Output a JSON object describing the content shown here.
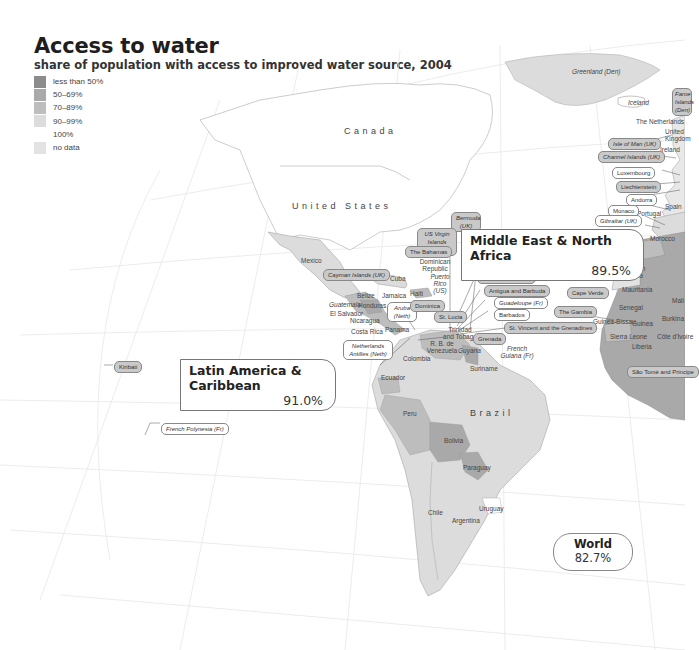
{
  "header": {
    "title": "Access to water",
    "subtitle": "share of population with access to improved water source, 2004"
  },
  "legend": [
    {
      "label": "less than 50%",
      "color": "#8c8c8c"
    },
    {
      "label": "50–69%",
      "color": "#a9a9a9"
    },
    {
      "label": "70–89%",
      "color": "#bdbdbd"
    },
    {
      "label": "90–99%",
      "color": "#dcdcdc"
    },
    {
      "label": "100%",
      "color": "#ffffff"
    },
    {
      "label": "no data",
      "color": "#e3e3e3"
    }
  ],
  "regions": {
    "latin_america": {
      "name": "Latin America & Caribbean",
      "value": "91.0%"
    },
    "mena": {
      "name": "Middle East & North Africa",
      "value": "89.5%"
    },
    "world": {
      "name": "World",
      "value": "82.7%"
    }
  },
  "country_names": {
    "canada": "Canada",
    "united_states": "United States",
    "brazil": "Brazil"
  },
  "labels": {
    "greenland": "Greenland (Den)",
    "iceland": "Iceland",
    "faroe": "Faroe Islands (Den)",
    "netherlands": "The Netherlands",
    "united_kingdom": "United Kingdom",
    "ireland": "Ireland",
    "isle_of_man": "Isle of Man (UK)",
    "channel_islands": "Channel Islands (UK)",
    "luxembourg": "Luxembourg",
    "liechtenstein": "Liechtenstein",
    "andorra": "Andorra",
    "spain": "Spain",
    "monaco": "Monaco",
    "portugal": "Portugal",
    "gibraltar": "Gibraltar (UK)",
    "morocco": "Morocco",
    "western_sahara": "Former Spanish Sahara",
    "mauritania": "Mauritania",
    "mali": "Mali",
    "cape_verde": "Cape Verde",
    "senegal": "Senegal",
    "gambia": "The Gambia",
    "guinea_bissau": "Guinea-Bissau",
    "guinea": "Guinea",
    "sierra_leone": "Sierra Leone",
    "liberia": "Liberia",
    "burkina": "Burkina",
    "cote_divoire": "Côte d'Ivoire",
    "sao_tome": "São Tomé and Principe",
    "bermuda": "Bermuda (UK)",
    "us_virgin": "US Virgin Islands (US)",
    "bahamas": "The Bahamas",
    "dominican_republic": "Dominican Republic",
    "puerto_rico": "Puerto Rico (US)",
    "cuba": "Cuba",
    "haiti": "Haiti",
    "jamaica": "Jamaica",
    "cayman": "Cayman Islands (UK)",
    "mexico": "Mexico",
    "belize": "Belize",
    "guatemala": "Guatemala",
    "honduras": "Honduras",
    "el_salvador": "El Salvador",
    "nicaragua": "Nicaragua",
    "costa_rica": "Costa Rica",
    "panama": "Panama",
    "aruba": "Aruba (Neth)",
    "netherlands_antilles": "Netherlands Antilles (Neth)",
    "dominica": "Dominica",
    "st_lucia": "St. Lucia",
    "st_kitts": "St. Kitts and Nevis",
    "antigua": "Antigua and Barbuda",
    "guadeloupe": "Guadeloupe (Fr)",
    "barbados": "Barbados",
    "st_vincent": "St. Vincent and the Grenadines",
    "grenada": "Grenada",
    "trinidad": "Trinidad and Tobago",
    "venezuela": "R. B. de Venezuela",
    "guyana": "Guyana",
    "suriname": "Suriname",
    "french_guiana": "French Guiana (Fr)",
    "colombia": "Colombia",
    "ecuador": "Ecuador",
    "peru": "Peru",
    "bolivia": "Bolivia",
    "paraguay": "Paraguay",
    "chile": "Chile",
    "argentina": "Argentina",
    "uruguay": "Uruguay",
    "kiribati": "Kiribati",
    "french_polynesia": "French Polynesia (Fr)"
  }
}
